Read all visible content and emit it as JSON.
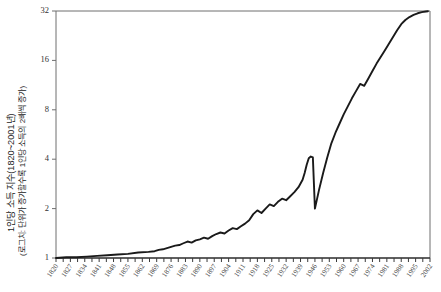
{
  "chart_data": {
    "type": "line",
    "title": "",
    "subtitle": "",
    "ylabel_main": "1인당 소득 지수(1820~2001년)",
    "ylabel_sub": "(로그치: 단위가 증가할수록 1인당 소득의 2배씩 증가)",
    "xlabel": "",
    "yscale": "log2",
    "ylim": [
      1,
      32
    ],
    "ytick_labels": [
      "32",
      "16",
      "8",
      "4",
      "2",
      "1"
    ],
    "ytick_values": [
      32,
      16,
      8,
      4,
      2,
      1
    ],
    "xlim": [
      1820,
      2002
    ],
    "grid": false,
    "legend": "none",
    "xtick_labels": [
      "1820",
      "1827",
      "1834",
      "1841",
      "1848",
      "1855",
      "1862",
      "1869",
      "1876",
      "1883",
      "1890",
      "1897",
      "1904",
      "1911",
      "1918",
      "1925",
      "1932",
      "1939",
      "1946",
      "1953",
      "1960",
      "1967",
      "1974",
      "1981",
      "1988",
      "1995",
      "2002"
    ],
    "xtick_values": [
      1820,
      1827,
      1834,
      1841,
      1848,
      1855,
      1862,
      1869,
      1876,
      1883,
      1890,
      1897,
      1904,
      1911,
      1918,
      1925,
      1932,
      1939,
      1946,
      1953,
      1960,
      1967,
      1974,
      1981,
      1988,
      1995,
      2002
    ],
    "series": [
      {
        "name": "1인당 소득 지수",
        "color": "#1a1a1a",
        "x": [
          1820,
          1825,
          1830,
          1835,
          1840,
          1845,
          1850,
          1855,
          1860,
          1865,
          1868,
          1870,
          1872,
          1874,
          1876,
          1878,
          1880,
          1882,
          1884,
          1886,
          1888,
          1890,
          1892,
          1894,
          1896,
          1898,
          1900,
          1902,
          1904,
          1906,
          1908,
          1910,
          1912,
          1914,
          1916,
          1918,
          1920,
          1922,
          1924,
          1926,
          1928,
          1930,
          1932,
          1934,
          1936,
          1938,
          1940,
          1941,
          1942,
          1943,
          1944,
          1945,
          1946,
          1948,
          1950,
          1952,
          1954,
          1956,
          1958,
          1960,
          1962,
          1964,
          1966,
          1968,
          1970,
          1972,
          1974,
          1976,
          1978,
          1980,
          1982,
          1984,
          1986,
          1988,
          1990,
          1992,
          1994,
          1996,
          1998,
          2000,
          2001
        ],
        "y": [
          1.0,
          1.01,
          1.01,
          1.02,
          1.03,
          1.04,
          1.05,
          1.06,
          1.08,
          1.09,
          1.1,
          1.12,
          1.13,
          1.15,
          1.17,
          1.19,
          1.2,
          1.23,
          1.26,
          1.24,
          1.28,
          1.3,
          1.33,
          1.31,
          1.36,
          1.4,
          1.43,
          1.41,
          1.47,
          1.52,
          1.5,
          1.56,
          1.62,
          1.7,
          1.85,
          1.95,
          1.88,
          2.0,
          2.12,
          2.07,
          2.2,
          2.3,
          2.25,
          2.38,
          2.52,
          2.7,
          3.0,
          3.3,
          3.7,
          4.05,
          4.15,
          4.1,
          2.0,
          2.6,
          3.3,
          4.1,
          5.0,
          5.8,
          6.6,
          7.5,
          8.4,
          9.4,
          10.4,
          11.5,
          11.2,
          12.4,
          13.8,
          15.3,
          16.8,
          18.4,
          20.2,
          22.2,
          24.4,
          26.6,
          28.2,
          29.4,
          30.3,
          31.0,
          31.5,
          31.8,
          31.9
        ]
      }
    ],
    "annotations": []
  },
  "colors": {
    "line": "#1a1a1a",
    "axis": "#6e6e6e",
    "axis_bottom": "#2b2b2b",
    "background": "#ffffff",
    "text": "#333333"
  }
}
